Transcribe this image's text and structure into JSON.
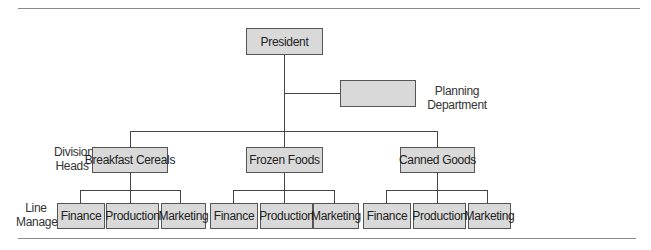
{
  "diagram": {
    "type": "organization-chart",
    "president": {
      "label": "President"
    },
    "staff": {
      "label": "",
      "caption_line1": "Planning",
      "caption_line2": "Department"
    },
    "level_labels": {
      "division_line1": "Division",
      "division_line2": "Heads",
      "line_line1": "Line",
      "line_line2": "Managers"
    },
    "divisions": [
      {
        "label": "Breakfast Cereals",
        "managers": [
          "Finance",
          "Production",
          "Marketing"
        ]
      },
      {
        "label": "Frozen Foods",
        "managers": [
          "Finance",
          "Production",
          "Marketing"
        ]
      },
      {
        "label": "Canned Goods",
        "managers": [
          "Finance",
          "Production",
          "Marketing"
        ]
      }
    ],
    "colors": {
      "box_fill": "#d9d9d9",
      "box_border": "#555555",
      "connector": "#444444",
      "rule": "#8a8a8a"
    }
  }
}
